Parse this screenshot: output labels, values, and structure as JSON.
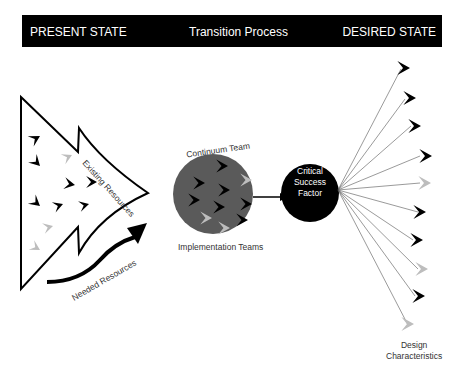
{
  "header": {
    "left": "PRESENT STATE",
    "middle": "Transition Process",
    "right": "DESIRED STATE"
  },
  "labels": {
    "existing_resources": "Existing Resources",
    "needed_resources": "Needed Resources",
    "continuum_team": "Continuum Team",
    "implementation_teams": "Implementation Teams",
    "csf_line1": "Critical",
    "csf_line2": "Success",
    "csf_line3": "Factor",
    "design_line1": "Design",
    "design_line2": "Characteristics"
  },
  "colors": {
    "header_bg": "#000000",
    "team_circle": "#5a5a5a",
    "arrow_dark": "#000000",
    "arrow_light": "#bdbdbd"
  }
}
